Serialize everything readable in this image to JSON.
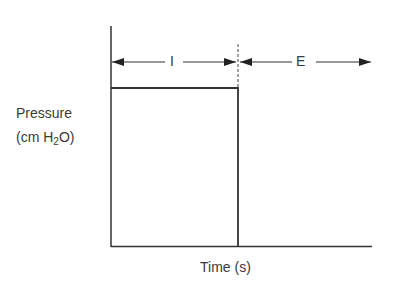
{
  "diagram": {
    "type": "pressure-time waveform (square wave)",
    "y_axis": {
      "label_line1": "Pressure",
      "label_line2_prefix": "(cm H",
      "label_line2_sub": "2",
      "label_line2_suffix": "O)"
    },
    "x_axis": {
      "label": "Time (s)"
    },
    "phases": [
      {
        "label": "I",
        "meaning": "inspiration",
        "shape": "constant plateau pressure"
      },
      {
        "label": "E",
        "meaning": "expiration",
        "shape": "pressure drops to baseline"
      }
    ],
    "colors": {
      "line": "#333333",
      "text": "#3a3a3a",
      "background": "#ffffff"
    }
  }
}
